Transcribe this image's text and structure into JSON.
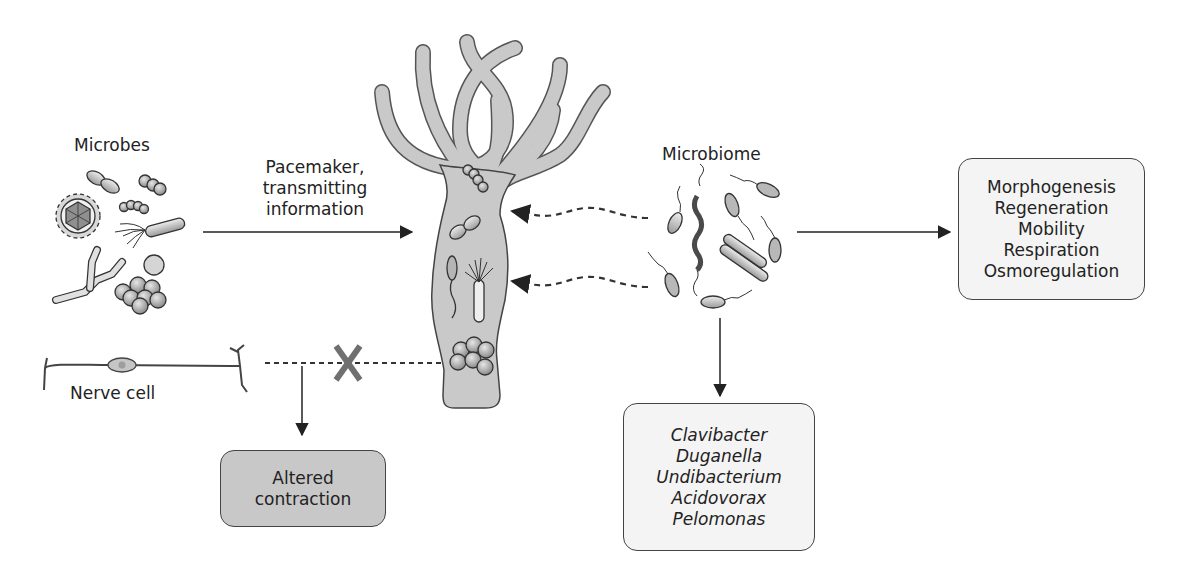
{
  "labels": {
    "microbes": "Microbes",
    "pacemaker": [
      "Pacemaker,",
      "transmitting",
      "information"
    ],
    "microbiome": "Microbiome",
    "nerve_cell": "Nerve cell",
    "block_mark": "X"
  },
  "boxes": {
    "functions": {
      "lines": [
        "Morphogenesis",
        "Regeneration",
        "Mobility",
        "Respiration",
        "Osmoregulation"
      ]
    },
    "genera": {
      "lines": [
        "Clavibacter",
        "Duganella",
        "Undibacterium",
        "Acidovorax",
        "Pelomonas"
      ]
    },
    "altered_contraction": {
      "lines": [
        "Altered",
        "contraction"
      ]
    }
  },
  "colors": {
    "stroke": "#333333",
    "hydra_fill": "#c9c9c9",
    "box_light": "#f4f4f4",
    "box_dark": "#c8c8c8",
    "x_mark": "#707070",
    "spirochete": "#4a4a4a"
  },
  "icons": {
    "hydra": "hydra-polyp-illustration",
    "virus": "virus-icon",
    "bacteria": "bacteria-icon",
    "nerve": "nerve-cell-icon"
  }
}
